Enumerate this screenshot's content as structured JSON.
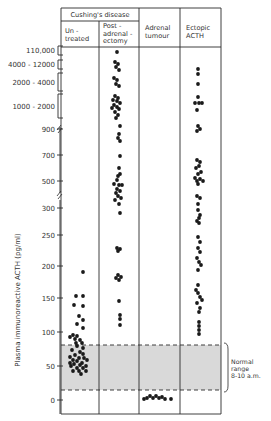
{
  "chart_data": {
    "type": "scatter",
    "title": "",
    "ylabel": "Plasma immunoreactive ACTH (pg/ml)",
    "xlabel": "",
    "header": {
      "group_label": "Cushing's disease",
      "columns": [
        {
          "lines": [
            "Un -",
            "treated"
          ]
        },
        {
          "lines": [
            "Post -",
            "adrenal -",
            "ectomy"
          ]
        },
        {
          "lines": [
            "Adrenal",
            "tumour"
          ]
        },
        {
          "lines": [
            "Ectopic",
            "ACTH"
          ]
        }
      ]
    },
    "categories": [
      "Untreated (Cushing's disease)",
      "Post-adrenalectomy (Cushing's disease)",
      "Adrenal tumour",
      "Ectopic ACTH"
    ],
    "y_ticks": [
      {
        "label": "0",
        "value": 0,
        "y": 400
      },
      {
        "label": "50",
        "value": 50,
        "y": 366
      },
      {
        "label": "100",
        "value": 100,
        "y": 332
      },
      {
        "label": "150",
        "value": 150,
        "y": 298
      },
      {
        "label": "200",
        "value": 200,
        "y": 266
      },
      {
        "label": "250",
        "value": 250,
        "y": 235
      },
      {
        "label": "300",
        "value": 300,
        "y": 208
      },
      {
        "label": "500",
        "value": 500,
        "y": 181
      },
      {
        "label": "700",
        "value": 700,
        "y": 155
      },
      {
        "label": "900",
        "value": 900,
        "y": 129
      }
    ],
    "y_brackets": [
      {
        "label": "1000 - 2000",
        "y_top": 94,
        "y_bottom": 118
      },
      {
        "label": "2000 - 4000",
        "y_top": 73,
        "y_bottom": 91
      },
      {
        "label": "4000 - 12000",
        "y_top": 60,
        "y_bottom": 69
      },
      {
        "label": "110,000",
        "y_top": 46,
        "y_bottom": 55
      }
    ],
    "axis_breaks": [
      129,
      195
    ],
    "normal_range": {
      "label_lines": [
        "Normal",
        "range",
        "8-10 a.m."
      ],
      "low": 15,
      "high": 80,
      "y_top": 345,
      "y_bottom": 390
    },
    "series": [
      {
        "name": "Untreated",
        "points": [
          [
            83,
            272
          ],
          [
            76,
            296
          ],
          [
            83,
            296
          ],
          [
            74,
            305
          ],
          [
            83,
            306
          ],
          [
            79,
            316
          ],
          [
            83,
            320
          ],
          [
            77,
            324
          ],
          [
            83,
            328
          ],
          [
            73,
            335
          ],
          [
            77,
            336
          ],
          [
            70,
            337
          ],
          [
            75,
            339
          ],
          [
            80,
            340
          ],
          [
            76,
            343
          ],
          [
            82,
            343
          ],
          [
            77,
            346
          ],
          [
            83,
            348
          ],
          [
            72,
            350
          ],
          [
            80,
            352
          ],
          [
            83,
            354
          ],
          [
            75,
            355
          ],
          [
            70,
            357
          ],
          [
            79,
            358
          ],
          [
            84,
            358
          ],
          [
            73,
            360
          ],
          [
            87,
            360
          ],
          [
            77,
            361
          ],
          [
            70,
            363
          ],
          [
            82,
            363
          ],
          [
            74,
            364
          ],
          [
            80,
            365
          ],
          [
            86,
            366
          ],
          [
            71,
            366
          ],
          [
            77,
            368
          ],
          [
            83,
            368
          ],
          [
            73,
            371
          ],
          [
            79,
            371
          ],
          [
            86,
            371
          ],
          [
            81,
            374
          ]
        ]
      },
      {
        "name": "Post-adrenalectomy",
        "points": [
          [
            117,
            52
          ],
          [
            115,
            62
          ],
          [
            118,
            64
          ],
          [
            116,
            67
          ],
          [
            119,
            70
          ],
          [
            114,
            78
          ],
          [
            117,
            80
          ],
          [
            116,
            84
          ],
          [
            119,
            86
          ],
          [
            115,
            96
          ],
          [
            118,
            98
          ],
          [
            113,
            100
          ],
          [
            117,
            101
          ],
          [
            120,
            103
          ],
          [
            114,
            105
          ],
          [
            117,
            107
          ],
          [
            112,
            108
          ],
          [
            119,
            109
          ],
          [
            115,
            112
          ],
          [
            118,
            115
          ],
          [
            116,
            118
          ],
          [
            120,
            126
          ],
          [
            119,
            134
          ],
          [
            118,
            138
          ],
          [
            120,
            141
          ],
          [
            120,
            156
          ],
          [
            119,
            168
          ],
          [
            120,
            174
          ],
          [
            118,
            176
          ],
          [
            117,
            180
          ],
          [
            114,
            184
          ],
          [
            119,
            185
          ],
          [
            122,
            185
          ],
          [
            117,
            189
          ],
          [
            120,
            191
          ],
          [
            116,
            193
          ],
          [
            118,
            196
          ],
          [
            121,
            198
          ],
          [
            115,
            200
          ],
          [
            119,
            204
          ],
          [
            120,
            213
          ],
          [
            117,
            248
          ],
          [
            120,
            249
          ],
          [
            118,
            251
          ],
          [
            118,
            275
          ],
          [
            121,
            277
          ],
          [
            116,
            278
          ],
          [
            119,
            280
          ],
          [
            119,
            301
          ],
          [
            120,
            315
          ],
          [
            120,
            319
          ],
          [
            120,
            325
          ]
        ]
      },
      {
        "name": "Adrenal tumour",
        "points": [
          [
            144,
            399
          ],
          [
            147,
            398
          ],
          [
            150,
            396
          ],
          [
            153,
            398
          ],
          [
            156,
            396
          ],
          [
            159,
            398
          ],
          [
            162,
            397
          ],
          [
            165,
            399
          ],
          [
            171,
            399
          ]
        ]
      },
      {
        "name": "Ectopic ACTH",
        "points": [
          [
            198,
            69
          ],
          [
            198,
            74
          ],
          [
            198,
            84
          ],
          [
            198,
            97
          ],
          [
            195,
            103
          ],
          [
            199,
            103
          ],
          [
            202,
            103
          ],
          [
            197,
            110
          ],
          [
            198,
            126
          ],
          [
            200,
            129
          ],
          [
            197,
            131
          ],
          [
            197,
            160
          ],
          [
            200,
            162
          ],
          [
            199,
            166
          ],
          [
            196,
            168
          ],
          [
            201,
            172
          ],
          [
            198,
            174
          ],
          [
            195,
            178
          ],
          [
            200,
            179
          ],
          [
            197,
            181
          ],
          [
            203,
            181
          ],
          [
            198,
            184
          ],
          [
            197,
            196
          ],
          [
            200,
            198
          ],
          [
            198,
            204
          ],
          [
            198,
            210
          ],
          [
            200,
            215
          ],
          [
            199,
            218
          ],
          [
            197,
            221
          ],
          [
            199,
            223
          ],
          [
            198,
            237
          ],
          [
            200,
            242
          ],
          [
            198,
            248
          ],
          [
            200,
            252
          ],
          [
            197,
            258
          ],
          [
            199,
            262
          ],
          [
            201,
            265
          ],
          [
            198,
            270
          ],
          [
            198,
            285
          ],
          [
            196,
            290
          ],
          [
            198,
            293
          ],
          [
            200,
            297
          ],
          [
            202,
            300
          ],
          [
            197,
            303
          ],
          [
            200,
            308
          ],
          [
            199,
            312
          ],
          [
            199,
            322
          ],
          [
            199,
            326
          ],
          [
            199,
            330
          ],
          [
            199,
            334
          ]
        ]
      }
    ],
    "layout": {
      "plot_left": 61,
      "plot_right": 221,
      "col_edges": [
        61,
        99,
        139,
        180,
        221
      ],
      "header_top": 8,
      "header_mid": 21,
      "header_bottom": 47,
      "plot_bottom": 414,
      "grid": false,
      "legend": "none"
    }
  }
}
